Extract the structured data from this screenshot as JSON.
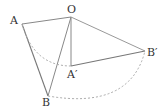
{
  "diagram": {
    "points": {
      "O": {
        "label": "O",
        "x": 71,
        "y": 17
      },
      "A": {
        "label": "A",
        "x": 22,
        "y": 24
      },
      "B": {
        "label": "B",
        "x": 48,
        "y": 96
      },
      "A_prime": {
        "label": "A′",
        "x": 71,
        "y": 66
      },
      "B_prime": {
        "label": "B′",
        "x": 145,
        "y": 51
      }
    },
    "segments": [
      "OA",
      "AB",
      "OB",
      "OA′",
      "A′B′",
      "OB′"
    ],
    "arcs": [
      "A→A′ (dashed, center O)",
      "B→B′ (dashed, center O)"
    ],
    "colors": {
      "line": "#888888",
      "dashed": "#aaaaaa",
      "text": "#333333"
    }
  }
}
